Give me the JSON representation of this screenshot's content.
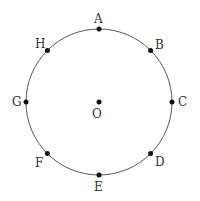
{
  "diagram": {
    "type": "circle-with-points",
    "center": {
      "label": "O",
      "x": 99,
      "y": 102
    },
    "radius": 73,
    "colors": {
      "stroke": "#555555",
      "point": "#111111",
      "text": "#333333"
    },
    "points": [
      {
        "label": "A",
        "angle_deg": 90
      },
      {
        "label": "B",
        "angle_deg": 45
      },
      {
        "label": "C",
        "angle_deg": 0
      },
      {
        "label": "D",
        "angle_deg": -45
      },
      {
        "label": "E",
        "angle_deg": -90
      },
      {
        "label": "F",
        "angle_deg": -135
      },
      {
        "label": "G",
        "angle_deg": 180
      },
      {
        "label": "H",
        "angle_deg": 135
      }
    ]
  }
}
